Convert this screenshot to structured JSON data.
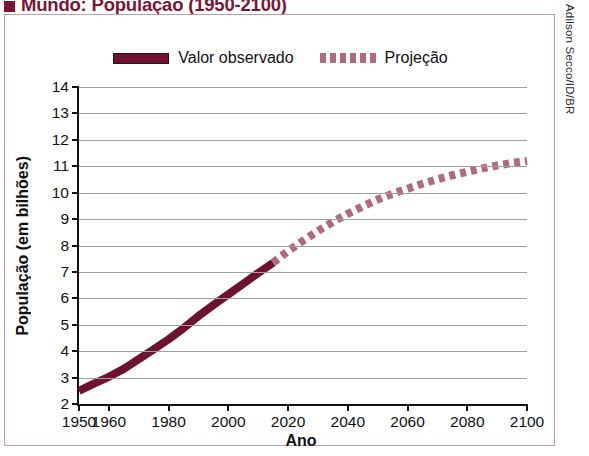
{
  "title": {
    "bullet": "square-bullet",
    "text": "Mundo: População (1950-2100)"
  },
  "credit": "Adilson Secco/ID/BR",
  "legend": [
    {
      "label": "Valor observado",
      "style": "solid",
      "color": "#6E1232"
    },
    {
      "label": "Projeção",
      "style": "dotted",
      "color": "#B06A80"
    }
  ],
  "chart_data": {
    "type": "line",
    "title": "Mundo: População (1950-2100)",
    "xlabel": "Ano",
    "ylabel": "População (em bilhões)",
    "xlim": [
      1950,
      2100
    ],
    "ylim": [
      2,
      14
    ],
    "grid": true,
    "legend_position": "top-center",
    "xticks": [
      1950,
      1960,
      1980,
      2000,
      2020,
      2040,
      2060,
      2080,
      2100
    ],
    "yticks": [
      2,
      3,
      4,
      5,
      6,
      7,
      8,
      9,
      10,
      11,
      12,
      13,
      14
    ],
    "series": [
      {
        "name": "Valor observado",
        "style": "solid",
        "color": "#6E1232",
        "x": [
          1950,
          1955,
          1960,
          1965,
          1970,
          1975,
          1980,
          1985,
          1990,
          1995,
          2000,
          2005,
          2010,
          2015
        ],
        "values": [
          2.5,
          2.77,
          3.03,
          3.33,
          3.7,
          4.07,
          4.45,
          4.87,
          5.33,
          5.75,
          6.15,
          6.55,
          6.96,
          7.35
        ]
      },
      {
        "name": "Projeção",
        "style": "dotted",
        "color": "#B06A80",
        "x": [
          2015,
          2020,
          2025,
          2030,
          2035,
          2040,
          2045,
          2050,
          2055,
          2060,
          2065,
          2070,
          2075,
          2080,
          2085,
          2090,
          2095,
          2100
        ],
        "values": [
          7.35,
          7.79,
          8.18,
          8.55,
          8.89,
          9.2,
          9.48,
          9.74,
          9.96,
          10.15,
          10.34,
          10.51,
          10.66,
          10.79,
          10.92,
          11.03,
          11.12,
          11.2
        ]
      }
    ],
    "annotations": []
  }
}
